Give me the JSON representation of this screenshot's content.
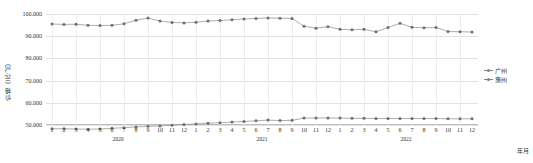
{
  "axes": {
    "y_title": "价格（元/㎡）",
    "x_title": "年月",
    "y_ticks": [
      "50.000",
      "60.000",
      "70.000",
      "80.000",
      "90.000",
      "100.000"
    ],
    "x_ticks": [
      "1",
      "2",
      "3",
      "4",
      "5",
      "6",
      "7",
      "8",
      "9",
      "10",
      "11",
      "12",
      "1",
      "2",
      "3",
      "4",
      "5",
      "6",
      "7",
      "8",
      "9",
      "10",
      "11",
      "12",
      "1",
      "2",
      "3",
      "4",
      "5",
      "6",
      "7",
      "8",
      "9",
      "10",
      "11",
      "12"
    ],
    "year_labels": [
      "2020",
      "2021",
      "2022"
    ]
  },
  "legend": {
    "items": [
      {
        "label": "广州",
        "color": "#808080"
      },
      {
        "label": "惠州",
        "color": "#808080"
      }
    ]
  },
  "colors": {
    "line": "#8a8a8a",
    "marker": "#6e6e6e",
    "grid": "#e2e2e2",
    "background": "#ffffff"
  },
  "chart_data": {
    "type": "line",
    "title": "",
    "xlabel": "年月",
    "ylabel": "价格（元/㎡）",
    "ylim": [
      50000,
      100000
    ],
    "grid": true,
    "legend_position": "right",
    "x": [
      "2020-1",
      "2020-2",
      "2020-3",
      "2020-4",
      "2020-5",
      "2020-6",
      "2020-7",
      "2020-8",
      "2020-9",
      "2020-10",
      "2020-11",
      "2020-12",
      "2021-1",
      "2021-2",
      "2021-3",
      "2021-4",
      "2021-5",
      "2021-6",
      "2021-7",
      "2021-8",
      "2021-9",
      "2021-10",
      "2021-11",
      "2021-12",
      "2022-1",
      "2022-2",
      "2022-3",
      "2022-4",
      "2022-5",
      "2022-6",
      "2022-7",
      "2022-8",
      "2022-9",
      "2022-10",
      "2022-11",
      "2022-12"
    ],
    "categories": [
      "1",
      "2",
      "3",
      "4",
      "5",
      "6",
      "7",
      "8",
      "9",
      "10",
      "11",
      "12",
      "1",
      "2",
      "3",
      "4",
      "5",
      "6",
      "7",
      "8",
      "9",
      "10",
      "11",
      "12",
      "1",
      "2",
      "3",
      "4",
      "5",
      "6",
      "7",
      "8",
      "9",
      "10",
      "11",
      "12"
    ],
    "series": [
      {
        "name": "广州",
        "color": "#808080",
        "values": [
          95500,
          95300,
          95400,
          94900,
          94800,
          94900,
          95600,
          97200,
          98200,
          96800,
          96200,
          96000,
          96300,
          96800,
          97100,
          97400,
          97800,
          98000,
          98200,
          98100,
          98000,
          94500,
          93600,
          94300,
          93100,
          92900,
          93100,
          92000,
          93900,
          95800,
          94000,
          93800,
          93900,
          92100,
          92000,
          91900
        ]
      },
      {
        "name": "惠州",
        "color": "#808080",
        "values": [
          48300,
          48300,
          48200,
          48100,
          48200,
          48500,
          48800,
          49100,
          49400,
          49600,
          49900,
          50200,
          50500,
          50800,
          51000,
          51300,
          51600,
          51900,
          52200,
          52000,
          52100,
          53100,
          53200,
          53200,
          53100,
          53000,
          53000,
          52900,
          52900,
          52900,
          52900,
          52900,
          52900,
          52800,
          52800,
          52800
        ]
      }
    ]
  }
}
